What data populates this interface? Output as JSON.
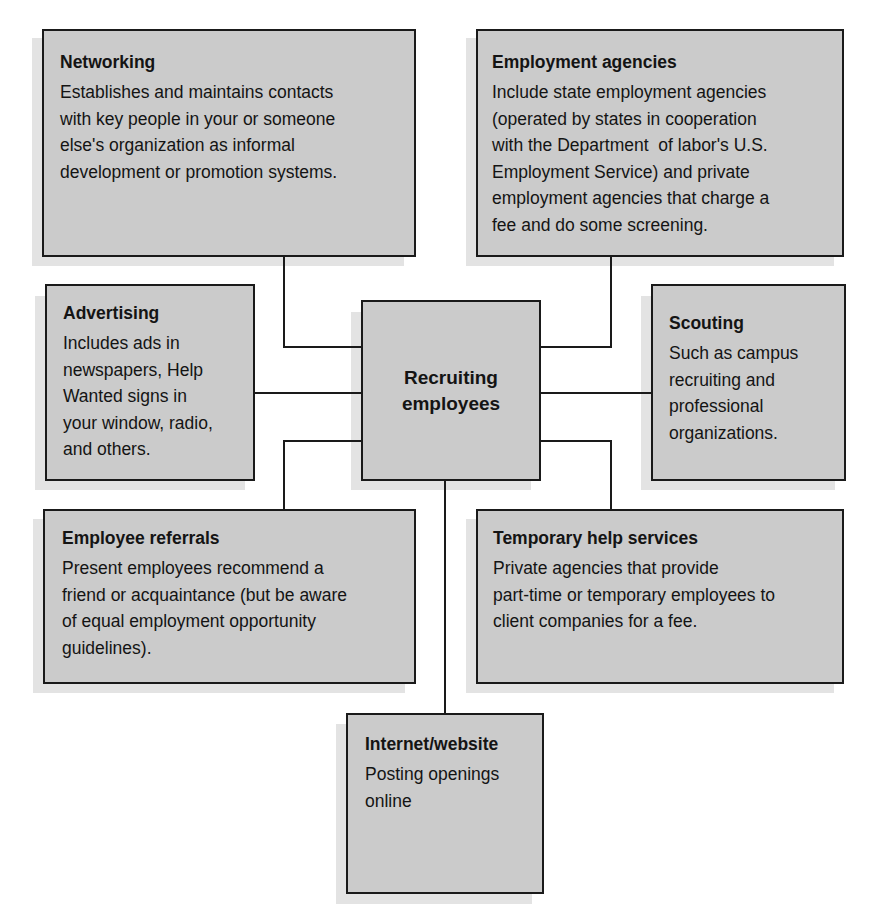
{
  "header": {
    "cut_text": "employees"
  },
  "center": {
    "title": "Recruiting employees",
    "line1": "Recruiting",
    "line2": "employees"
  },
  "nodes": [
    {
      "id": "networking",
      "title": "Networking",
      "lines": [
        "Establishes and maintains contacts",
        "with key people in your or someone",
        "else's organization as informal",
        "development or promotion systems."
      ]
    },
    {
      "id": "employment-agencies",
      "title": "Employment agencies",
      "lines": [
        "Include state employment agencies",
        "(operated by states in cooperation",
        "with the Department  of labor's U.S.",
        "Employment Service) and private",
        "employment agencies that charge a",
        "fee and do some screening."
      ]
    },
    {
      "id": "advertising",
      "title": "Advertising",
      "lines": [
        "Includes ads in",
        "newspapers, Help",
        "Wanted signs in",
        "your window, radio,",
        "and others."
      ]
    },
    {
      "id": "scouting",
      "title": "Scouting",
      "lines": [
        "Such as campus",
        "recruiting and",
        "professional",
        "organizations."
      ]
    },
    {
      "id": "employee-referrals",
      "title": "Employee referrals",
      "lines": [
        "Present employees recommend a",
        "friend or acquaintance (but be aware",
        "of equal employment opportunity",
        "guidelines)."
      ]
    },
    {
      "id": "temporary-help-services",
      "title": "Temporary help services",
      "lines": [
        "Private agencies that provide",
        "part-time or temporary employees to",
        "client companies for a fee."
      ]
    },
    {
      "id": "internet-website",
      "title": "Internet/website",
      "lines": [
        "Posting openings",
        "online"
      ]
    }
  ],
  "colors": {
    "box_fill": "#cbcbcb",
    "border": "#1a1a1a",
    "shadow": "#e3e3e3",
    "background": "#ffffff"
  }
}
